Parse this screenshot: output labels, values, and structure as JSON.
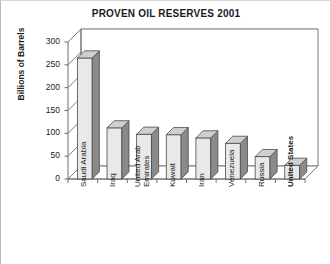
{
  "chart_data": {
    "type": "bar",
    "title": "PROVEN OIL RESERVES 2001",
    "xlabel": "",
    "ylabel": "Billions of Barrels",
    "ylim": [
      0,
      300
    ],
    "yticks": [
      0,
      50,
      100,
      150,
      200,
      250,
      300
    ],
    "ytick_labels": [
      "0",
      "50",
      "100",
      "150",
      "200",
      "250",
      "300"
    ],
    "grid": true,
    "legend": "none",
    "style": "3d-bar",
    "categories": [
      "Saudi Arabia",
      "Iraq",
      "United Arab Emirates",
      "Kuwait",
      "Iran",
      "Venezuela",
      "Russia",
      "United States"
    ],
    "category_label_lines": [
      [
        "Saudi Arabia"
      ],
      [
        "Iraq"
      ],
      [
        "United Arab",
        "Emirates"
      ],
      [
        "Kuwait"
      ],
      [
        "Iran"
      ],
      [
        "Venezuela"
      ],
      [
        "Russia"
      ],
      [
        "United States"
      ]
    ],
    "values": [
      265,
      112,
      98,
      97,
      90,
      78,
      49,
      30
    ],
    "colors": {
      "bar_face": "#e9e9e9",
      "bar_side": "#8a8a8a",
      "bar_top": "#cfcfcf",
      "bar_outline": "#4a4a4a",
      "grid": "#b4b4b4",
      "axis": "#6e6e6e",
      "text": "#1b1b1b",
      "background": "#ffffff"
    }
  }
}
